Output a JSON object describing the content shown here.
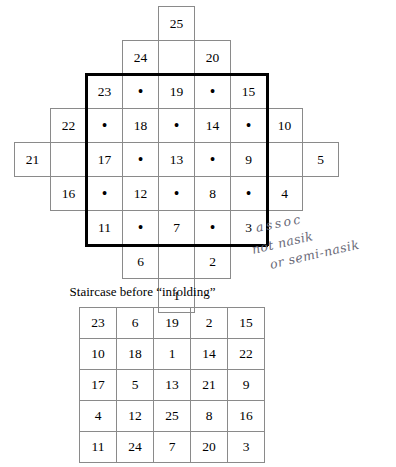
{
  "figure": {
    "caption": "Staircase before “infolding”"
  },
  "diamond": {
    "description": "Diamond-shaped staircase arrangement of numbered cells with dot cells between them",
    "dot_glyph": "•",
    "rows": [
      [
        {
          "col": 3,
          "text": "25",
          "kind": "number",
          "heavy": false
        }
      ],
      [
        {
          "col": 2,
          "text": "24",
          "kind": "number",
          "heavy": false
        },
        {
          "col": 4,
          "text": "20",
          "kind": "number",
          "heavy": false
        }
      ],
      [
        {
          "col": 1,
          "text": "23",
          "kind": "number",
          "heavy": true
        },
        {
          "col": 2,
          "text": "•",
          "kind": "dot",
          "heavy": true
        },
        {
          "col": 3,
          "text": "19",
          "kind": "number",
          "heavy": true
        },
        {
          "col": 4,
          "text": "•",
          "kind": "dot",
          "heavy": true
        },
        {
          "col": 5,
          "text": "15",
          "kind": "number",
          "heavy": true
        }
      ],
      [
        {
          "col": 0,
          "text": "22",
          "kind": "number",
          "heavy": false
        },
        {
          "col": 1,
          "text": "•",
          "kind": "dot",
          "heavy": true
        },
        {
          "col": 2,
          "text": "18",
          "kind": "number",
          "heavy": true
        },
        {
          "col": 3,
          "text": "•",
          "kind": "dot",
          "heavy": true
        },
        {
          "col": 4,
          "text": "14",
          "kind": "number",
          "heavy": true
        },
        {
          "col": 5,
          "text": "•",
          "kind": "dot",
          "heavy": true
        },
        {
          "col": 6,
          "text": "10",
          "kind": "number",
          "heavy": false
        }
      ],
      [
        {
          "col": -1,
          "text": "21",
          "kind": "number",
          "heavy": false
        },
        {
          "col": 1,
          "text": "17",
          "kind": "number",
          "heavy": true
        },
        {
          "col": 2,
          "text": "•",
          "kind": "dot",
          "heavy": true
        },
        {
          "col": 3,
          "text": "13",
          "kind": "number",
          "heavy": true
        },
        {
          "col": 4,
          "text": "•",
          "kind": "dot",
          "heavy": true
        },
        {
          "col": 5,
          "text": "9",
          "kind": "number",
          "heavy": true
        },
        {
          "col": 7,
          "text": "5",
          "kind": "number",
          "heavy": false
        }
      ],
      [
        {
          "col": 0,
          "text": "16",
          "kind": "number",
          "heavy": false
        },
        {
          "col": 1,
          "text": "•",
          "kind": "dot",
          "heavy": true
        },
        {
          "col": 2,
          "text": "12",
          "kind": "number",
          "heavy": true
        },
        {
          "col": 3,
          "text": "•",
          "kind": "dot",
          "heavy": true
        },
        {
          "col": 4,
          "text": "8",
          "kind": "number",
          "heavy": true
        },
        {
          "col": 5,
          "text": "•",
          "kind": "dot",
          "heavy": true
        },
        {
          "col": 6,
          "text": "4",
          "kind": "number",
          "heavy": false
        }
      ],
      [
        {
          "col": 1,
          "text": "11",
          "kind": "number",
          "heavy": true
        },
        {
          "col": 2,
          "text": "•",
          "kind": "dot",
          "heavy": true
        },
        {
          "col": 3,
          "text": "7",
          "kind": "number",
          "heavy": true
        },
        {
          "col": 4,
          "text": "•",
          "kind": "dot",
          "heavy": true
        },
        {
          "col": 5,
          "text": "3",
          "kind": "number",
          "heavy": true
        }
      ],
      [
        {
          "col": 2,
          "text": "6",
          "kind": "number",
          "heavy": false
        },
        {
          "col": 4,
          "text": "2",
          "kind": "number",
          "heavy": false
        }
      ],
      [
        {
          "col": 3,
          "text": "1",
          "kind": "number",
          "heavy": false
        }
      ]
    ]
  },
  "square_grid": {
    "rows": [
      [
        "23",
        "6",
        "19",
        "2",
        "15"
      ],
      [
        "10",
        "18",
        "1",
        "14",
        "22"
      ],
      [
        "17",
        "5",
        "13",
        "21",
        "9"
      ],
      [
        "4",
        "12",
        "25",
        "8",
        "16"
      ],
      [
        "11",
        "24",
        "7",
        "20",
        "3"
      ]
    ]
  },
  "annotation": {
    "line1": "assoc",
    "line2": "not nasik",
    "line3": "or semi-nasik"
  }
}
